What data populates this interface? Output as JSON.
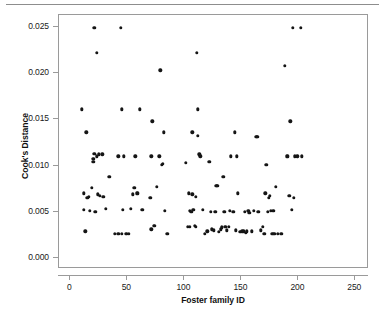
{
  "figure": {
    "background_color": "#ffffff",
    "frame_color": "#9a9a9a",
    "point_color": "#151515",
    "rule_color": "#8d8d8d"
  },
  "chart_data": {
    "type": "scatter",
    "title": "",
    "xlabel": "Foster family ID",
    "ylabel": "Cook's Distance",
    "xlim": [
      -10,
      262
    ],
    "ylim": [
      -0.0012,
      0.0263
    ],
    "xticks": [
      0,
      50,
      100,
      150,
      200,
      250
    ],
    "xtick_labels": [
      "0",
      "50",
      "100",
      "150",
      "200",
      "250"
    ],
    "yticks": [
      0.0,
      0.005,
      0.01,
      0.015,
      0.02,
      0.025
    ],
    "ytick_labels": [
      "0.000",
      "0.005",
      "0.010",
      "0.015",
      "0.020",
      "0.025"
    ],
    "grid": false,
    "legend": null,
    "marker": "circle",
    "marker_size": 3.4,
    "points": [
      [
        10,
        0.0161
      ],
      [
        12,
        0.007
      ],
      [
        12,
        0.0052
      ],
      [
        13,
        0.0029
      ],
      [
        14,
        0.0136
      ],
      [
        15,
        0.0065
      ],
      [
        16,
        0.0066
      ],
      [
        17,
        0.0051
      ],
      [
        19,
        0.0076
      ],
      [
        20,
        0.0104
      ],
      [
        20,
        0.0107
      ],
      [
        21,
        0.0249
      ],
      [
        21,
        0.0113
      ],
      [
        22,
        0.005
      ],
      [
        23,
        0.0222
      ],
      [
        23,
        0.011
      ],
      [
        24,
        0.0069
      ],
      [
        25,
        0.0112
      ],
      [
        26,
        0.0067
      ],
      [
        28,
        0.0112
      ],
      [
        29,
        0.0066
      ],
      [
        31,
        0.0053
      ],
      [
        34,
        0.0088
      ],
      [
        39,
        0.0026
      ],
      [
        42,
        0.011
      ],
      [
        42,
        0.0026
      ],
      [
        44,
        0.0249
      ],
      [
        45,
        0.0161
      ],
      [
        45,
        0.0026
      ],
      [
        46,
        0.0052
      ],
      [
        47,
        0.011
      ],
      [
        49,
        0.0026
      ],
      [
        51,
        0.0026
      ],
      [
        53,
        0.0053
      ],
      [
        55,
        0.0069
      ],
      [
        56,
        0.0076
      ],
      [
        57,
        0.011
      ],
      [
        58,
        0.007
      ],
      [
        59,
        0.007
      ],
      [
        61,
        0.0161
      ],
      [
        63,
        0.0052
      ],
      [
        70,
        0.0065
      ],
      [
        71,
        0.011
      ],
      [
        71,
        0.0031
      ],
      [
        72,
        0.0148
      ],
      [
        73,
        0.0035
      ],
      [
        74,
        0.0035
      ],
      [
        76,
        0.0077
      ],
      [
        78,
        0.011
      ],
      [
        79,
        0.0203
      ],
      [
        80,
        0.0101
      ],
      [
        81,
        0.0102
      ],
      [
        82,
        0.0136
      ],
      [
        83,
        0.0051
      ],
      [
        85,
        0.0026
      ],
      [
        101,
        0.0103
      ],
      [
        103,
        0.0034
      ],
      [
        104,
        0.007
      ],
      [
        105,
        0.0034
      ],
      [
        105,
        0.0051
      ],
      [
        106,
        0.005
      ],
      [
        107,
        0.0069
      ],
      [
        107,
        0.0136
      ],
      [
        108,
        0.0052
      ],
      [
        109,
        0.0035
      ],
      [
        110,
        0.0066
      ],
      [
        110,
        0.0034
      ],
      [
        111,
        0.0222
      ],
      [
        112,
        0.0161
      ],
      [
        112,
        0.0132
      ],
      [
        113,
        0.0112
      ],
      [
        114,
        0.011
      ],
      [
        116,
        0.0052
      ],
      [
        118,
        0.0026
      ],
      [
        120,
        0.0029
      ],
      [
        122,
        0.0104
      ],
      [
        123,
        0.005
      ],
      [
        124,
        0.0031
      ],
      [
        126,
        0.003
      ],
      [
        127,
        0.005
      ],
      [
        128,
        0.0078
      ],
      [
        129,
        0.0078
      ],
      [
        130,
        0.0028
      ],
      [
        132,
        0.0031
      ],
      [
        133,
        0.0033
      ],
      [
        134,
        0.0088
      ],
      [
        135,
        0.005
      ],
      [
        136,
        0.0034
      ],
      [
        137,
        0.003
      ],
      [
        139,
        0.0034
      ],
      [
        140,
        0.0051
      ],
      [
        141,
        0.011
      ],
      [
        143,
        0.005
      ],
      [
        144,
        0.0136
      ],
      [
        145,
        0.003
      ],
      [
        146,
        0.011
      ],
      [
        147,
        0.007
      ],
      [
        149,
        0.0028
      ],
      [
        151,
        0.0029
      ],
      [
        152,
        0.0029
      ],
      [
        153,
        0.005
      ],
      [
        154,
        0.0027
      ],
      [
        155,
        0.0029
      ],
      [
        156,
        0.0051
      ],
      [
        157,
        0.0049
      ],
      [
        159,
        0.0029
      ],
      [
        161,
        0.0051
      ],
      [
        163,
        0.0131
      ],
      [
        164,
        0.0131
      ],
      [
        165,
        0.005
      ],
      [
        167,
        0.003
      ],
      [
        169,
        0.0034
      ],
      [
        170,
        0.0026
      ],
      [
        171,
        0.007
      ],
      [
        172,
        0.0101
      ],
      [
        173,
        0.005
      ],
      [
        174,
        0.0065
      ],
      [
        175,
        0.0067
      ],
      [
        176,
        0.0051
      ],
      [
        177,
        0.0026
      ],
      [
        178,
        0.0051
      ],
      [
        179,
        0.0026
      ],
      [
        180,
        0.0077
      ],
      [
        182,
        0.0026
      ],
      [
        185,
        0.0026
      ],
      [
        188,
        0.0208
      ],
      [
        190,
        0.011
      ],
      [
        191,
        0.011
      ],
      [
        192,
        0.0067
      ],
      [
        193,
        0.0148
      ],
      [
        194,
        0.0052
      ],
      [
        195,
        0.0249
      ],
      [
        196,
        0.0065
      ],
      [
        197,
        0.011
      ],
      [
        199,
        0.011
      ],
      [
        202,
        0.0249
      ],
      [
        203,
        0.011
      ]
    ]
  }
}
